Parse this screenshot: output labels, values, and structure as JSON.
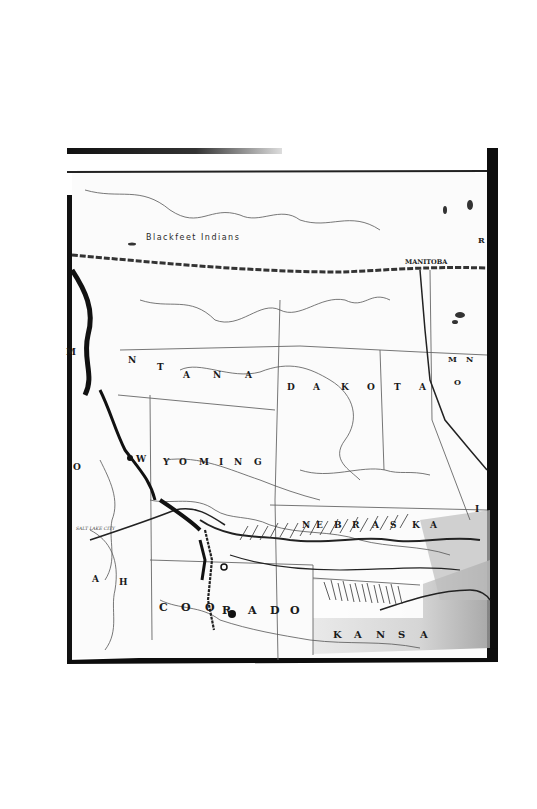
{
  "image": {
    "kind": "scanned historical map page",
    "background": "#ffffff",
    "ink": "#1a1a1a"
  },
  "map": {
    "regions": {
      "montana": "M  N T A N A",
      "montana_letters": [
        "M",
        "N",
        "T",
        "A",
        "N",
        "A"
      ],
      "dakota_letters": [
        "D",
        "A",
        "K",
        "O",
        "T",
        "A"
      ],
      "wyoming_letters": [
        "W",
        "Y",
        "O",
        "M",
        "I",
        "N",
        "G"
      ],
      "nebraska_letters": [
        "N",
        "E",
        "B",
        "R",
        "A",
        "S",
        "K",
        "A"
      ],
      "colorado_letters": [
        "C",
        "O",
        "L",
        "O",
        "R",
        "A",
        "D",
        "O"
      ],
      "kansas_letters": [
        "K",
        "A",
        "N",
        "S",
        "A",
        "S"
      ],
      "utah_letters": [
        "A",
        "H"
      ],
      "minnesota_letters": [
        "M",
        "I",
        "N",
        "N",
        "O"
      ],
      "idaho_letter": "O",
      "iowa_letter": "I",
      "edge_letter_r": "R"
    },
    "labels": {
      "tribe": "Blackfeet Indians",
      "province": "MANITOBA",
      "salt_lake": "SALT LAKE CITY"
    },
    "markers": [
      {
        "name": "city-marker-denver",
        "x": 232,
        "y": 614
      },
      {
        "name": "city-marker-wyoming",
        "x": 130,
        "y": 458
      },
      {
        "name": "city-marker-cheyenne",
        "x": 224,
        "y": 567
      }
    ]
  }
}
